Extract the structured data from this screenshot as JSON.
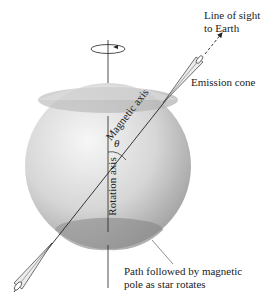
{
  "labels": {
    "line_of_sight_1": "Line of sight",
    "line_of_sight_2": "to Earth",
    "emission_cone": "Emission cone",
    "rotation_axis": "Rotation   axis",
    "magnetic_axis": "Magnetic axis",
    "theta": "θ",
    "path_1": "Path followed by magnetic",
    "path_2": "pole as star rotates"
  },
  "colors": {
    "sphere_light": "#f4f4f4",
    "sphere_dark": "#9a9a9a",
    "cap": "#a8a8a8",
    "line": "#222222"
  }
}
